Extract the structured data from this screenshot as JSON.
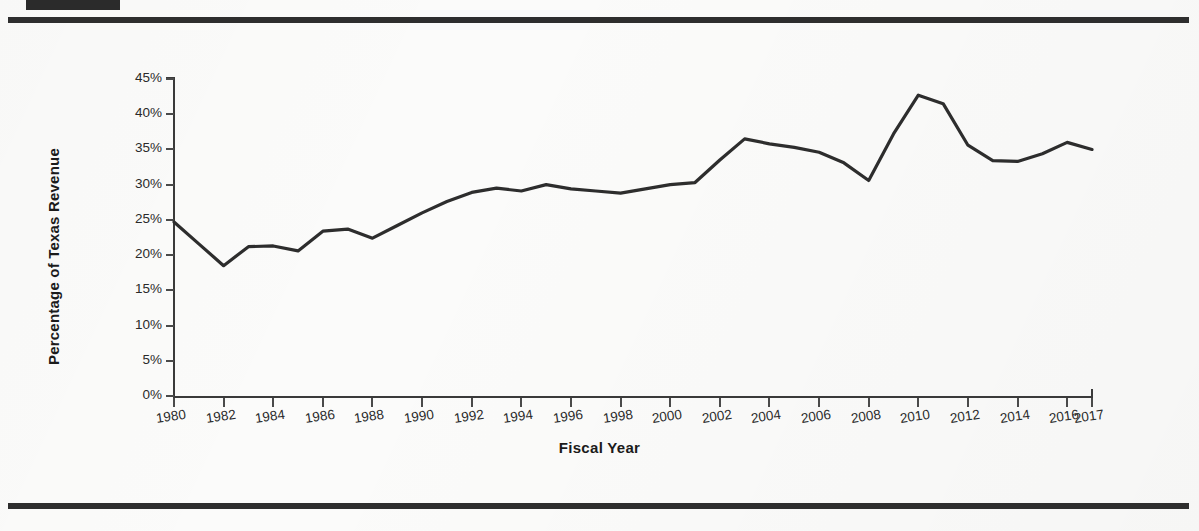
{
  "page": {
    "redaction_block": "redacted-header-bar",
    "top_rule": "horizontal-rule",
    "bottom_rule": "horizontal-rule"
  },
  "chart_data": {
    "type": "line",
    "title": "",
    "xlabel": "Fiscal Year",
    "ylabel": "Percentage of Texas Revenue",
    "grid": false,
    "legend": "none",
    "line_color": "#2d2d2d",
    "x": [
      1980,
      1981,
      1982,
      1983,
      1984,
      1985,
      1986,
      1987,
      1988,
      1989,
      1990,
      1991,
      1992,
      1993,
      1994,
      1995,
      1996,
      1997,
      1998,
      1999,
      2000,
      2001,
      2002,
      2003,
      2004,
      2005,
      2006,
      2007,
      2008,
      2009,
      2010,
      2011,
      2012,
      2013,
      2014,
      2015,
      2016,
      2017
    ],
    "values": [
      24.7,
      21.6,
      18.5,
      21.2,
      21.3,
      20.6,
      23.4,
      23.7,
      22.4,
      24.2,
      26.0,
      27.6,
      28.9,
      29.5,
      29.1,
      30.0,
      29.4,
      29.1,
      28.8,
      29.4,
      30.0,
      30.3,
      33.5,
      36.5,
      35.8,
      35.3,
      34.6,
      33.1,
      30.6,
      37.2,
      42.7,
      41.5,
      35.6,
      33.4,
      33.3,
      34.4,
      36.0,
      35.0
    ],
    "xlim": [
      1980,
      2017
    ],
    "ylim": [
      0,
      45
    ],
    "y_ticks": [
      "0%",
      "5%",
      "10%",
      "15%",
      "20%",
      "25%",
      "30%",
      "35%",
      "40%",
      "45%"
    ],
    "y_tick_values": [
      0,
      5,
      10,
      15,
      20,
      25,
      30,
      35,
      40,
      45
    ],
    "x_ticks": [
      "1980",
      "1982",
      "1984",
      "1986",
      "1988",
      "1990",
      "1992",
      "1994",
      "1996",
      "1998",
      "2000",
      "2002",
      "2004",
      "2006",
      "2008",
      "2010",
      "2012",
      "2014",
      "2016",
      "2017"
    ],
    "x_tick_values": [
      1980,
      1982,
      1984,
      1986,
      1988,
      1990,
      1992,
      1994,
      1996,
      1998,
      2000,
      2002,
      2004,
      2006,
      2008,
      2010,
      2012,
      2014,
      2016,
      2017
    ]
  }
}
